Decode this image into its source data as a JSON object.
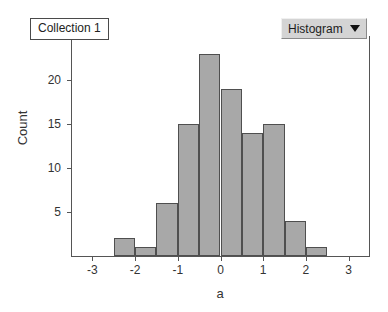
{
  "collection": {
    "label": "Collection 1"
  },
  "plot_type_selector": {
    "value": "Histogram",
    "caret_icon": "chevron-down-icon"
  },
  "colors": {
    "bar_fill": "#a8a8a8",
    "bar_stroke": "#4f4f4f",
    "axis": "#555555",
    "dropdown_bg": "#d4d4d4",
    "box_bg": "#ffffff",
    "text": "#333333"
  },
  "chart_data": {
    "type": "bar",
    "title": "",
    "subtitle": "",
    "xlabel": "a",
    "ylabel": "Count",
    "xlim": [
      -3.5,
      3.5
    ],
    "ylim": [
      0,
      25
    ],
    "grid": false,
    "legend": null,
    "bin_width": 0.5,
    "bin_starts": [
      -2.5,
      -2.0,
      -1.5,
      -1.0,
      -0.5,
      0.0,
      0.5,
      1.0,
      1.5,
      2.0
    ],
    "bin_ends": [
      -2.0,
      -1.5,
      -1.0,
      -0.5,
      0.0,
      0.5,
      1.0,
      1.5,
      2.0,
      2.5
    ],
    "categories": [
      "-2.5 to -2.0",
      "-2.0 to -1.5",
      "-1.5 to -1.0",
      "-1.0 to -0.5",
      "-0.5 to 0.0",
      "0.0 to 0.5",
      "0.5 to 1.0",
      "1.0 to 1.5",
      "1.5 to 2.0",
      "2.0 to 2.5"
    ],
    "values": [
      2,
      1,
      6,
      15,
      23,
      19,
      14,
      15,
      4,
      1
    ],
    "total_count": 100,
    "xticks": [
      -3,
      -2,
      -1,
      0,
      1,
      2,
      3
    ],
    "xticklabels": [
      "-3",
      "-2",
      "-1",
      "0",
      "1",
      "2",
      "3"
    ],
    "yticks": [
      5,
      10,
      15,
      20,
      25
    ],
    "yticklabels": [
      "5",
      "10",
      "15",
      "20",
      "25"
    ]
  }
}
